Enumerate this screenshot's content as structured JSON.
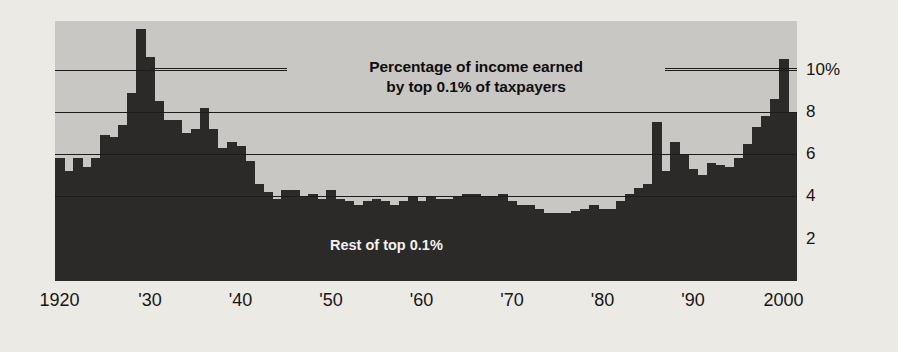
{
  "chart_data": {
    "type": "bar",
    "title": "Percentage of income earned by top 0.1% of taxpayers",
    "title_line1": "Percentage of income earned",
    "title_line2": "by top 0.1% of taxpayers",
    "inline_label": "Rest of top 0.1%",
    "xlabel": "",
    "ylabel": "",
    "ylim": [
      0,
      12.3
    ],
    "xlim": [
      1919.5,
      2001.5
    ],
    "grid": true,
    "gridlines": [
      4,
      6,
      8,
      10
    ],
    "legend_position": "none",
    "ytick_labels": [
      "10%",
      "8",
      "6",
      "4",
      "2"
    ],
    "ytick_values": [
      10,
      8,
      6,
      4,
      2
    ],
    "xtick_labels": [
      "1920",
      "'30",
      "'40",
      "'50",
      "'60",
      "'70",
      "'80",
      "'90",
      "2000"
    ],
    "xtick_values": [
      1920,
      1930,
      1940,
      1950,
      1960,
      1970,
      1980,
      1990,
      2000
    ],
    "categories": [
      1920,
      1921,
      1922,
      1923,
      1924,
      1925,
      1926,
      1927,
      1928,
      1929,
      1930,
      1931,
      1932,
      1933,
      1934,
      1935,
      1936,
      1937,
      1938,
      1939,
      1940,
      1941,
      1942,
      1943,
      1944,
      1945,
      1946,
      1947,
      1948,
      1949,
      1950,
      1951,
      1952,
      1953,
      1954,
      1955,
      1956,
      1957,
      1958,
      1959,
      1960,
      1961,
      1962,
      1963,
      1964,
      1965,
      1966,
      1967,
      1968,
      1969,
      1970,
      1971,
      1972,
      1973,
      1974,
      1975,
      1976,
      1977,
      1978,
      1979,
      1980,
      1981,
      1982,
      1983,
      1984,
      1985,
      1986,
      1987,
      1988,
      1989,
      1990,
      1991,
      1992,
      1993,
      1994,
      1995,
      1996,
      1997,
      1998,
      1999,
      2000,
      2001
    ],
    "values": [
      5.8,
      5.2,
      5.8,
      5.4,
      5.8,
      6.9,
      6.8,
      7.4,
      8.9,
      11.9,
      10.6,
      8.5,
      7.6,
      7.6,
      7.0,
      7.2,
      8.2,
      7.2,
      6.3,
      6.6,
      6.4,
      5.7,
      4.6,
      4.2,
      3.9,
      4.3,
      4.3,
      4.0,
      4.1,
      3.9,
      4.3,
      3.9,
      3.8,
      3.6,
      3.8,
      3.9,
      3.8,
      3.6,
      3.8,
      4.0,
      3.8,
      4.0,
      3.9,
      3.9,
      4.0,
      4.1,
      4.1,
      4.0,
      4.0,
      4.1,
      3.8,
      3.6,
      3.6,
      3.4,
      3.2,
      3.2,
      3.2,
      3.3,
      3.4,
      3.6,
      3.4,
      3.4,
      3.8,
      4.1,
      4.4,
      4.6,
      7.5,
      5.2,
      6.6,
      6.0,
      5.3,
      5.0,
      5.6,
      5.5,
      5.4,
      5.8,
      6.5,
      7.3,
      7.8,
      8.6,
      10.5,
      8.0
    ]
  },
  "annotations": {
    "callout_leader_left": true,
    "callout_leader_right": true
  },
  "colors": {
    "page_background": "#eceae5",
    "plot_background": "#c9c7c4",
    "bar": "#2c2a29",
    "gridline": "#1d1c1b",
    "text": "#171616",
    "inline_text": "#f3f2ef"
  }
}
